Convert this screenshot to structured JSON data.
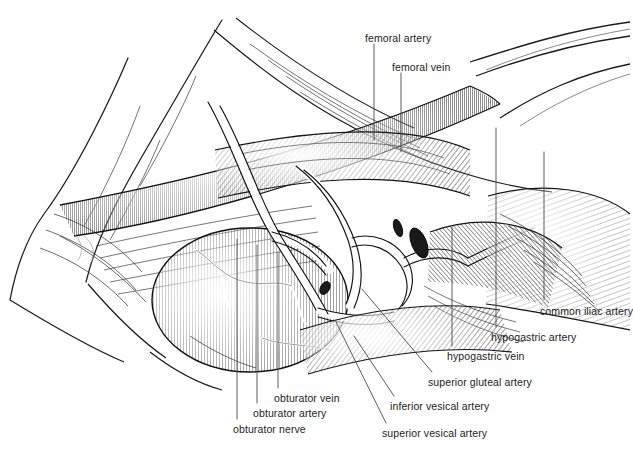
{
  "figure": {
    "title_fragment_cut_off": "any blood vessel together the result is an entire circuit",
    "background_color": "#ffffff",
    "ink_color": "#1b1b1b",
    "leader_line_color": "#4a4a4a",
    "technique": "pen-and-ink line engraving with hatching and stippling"
  },
  "labels": [
    {
      "id": "femoral-artery",
      "text": "femoral artery",
      "x": 365,
      "y": 33
    },
    {
      "id": "femoral-vein",
      "text": "femoral vein",
      "x": 392,
      "y": 62
    },
    {
      "id": "common-iliac-artery",
      "text": "common iliac artery",
      "x": 540,
      "y": 306
    },
    {
      "id": "hypogastric-artery",
      "text": "hypogastric artery",
      "x": 491,
      "y": 332
    },
    {
      "id": "hypogastric-vein",
      "text": "hypogastric vein",
      "x": 447,
      "y": 351
    },
    {
      "id": "superior-gluteal-artery",
      "text": "superior gluteal artery",
      "x": 428,
      "y": 377
    },
    {
      "id": "inferior-vesical-artery",
      "text": "inferior vesical artery",
      "x": 390,
      "y": 401
    },
    {
      "id": "superior-vesical-artery",
      "text": "superior vesical artery",
      "x": 382,
      "y": 428
    },
    {
      "id": "obturator-vein",
      "text": "obturator vein",
      "x": 274,
      "y": 393
    },
    {
      "id": "obturator-artery",
      "text": "obturator artery",
      "x": 253,
      "y": 408
    },
    {
      "id": "obturator-nerve",
      "text": "obturator nerve",
      "x": 233,
      "y": 424
    }
  ],
  "leader_lines": [
    {
      "id": "leader-femoral-artery",
      "points": "374,44 374,140"
    },
    {
      "id": "leader-femoral-vein",
      "points": "401,73 401,152"
    },
    {
      "id": "leader-common-iliac-artery",
      "points": "544,300 544,152"
    },
    {
      "id": "leader-hypogastric-artery",
      "points": "496,327 496,128"
    },
    {
      "id": "leader-hypogastric-vein",
      "points": "452,346 452,227"
    },
    {
      "id": "leader-superior-gluteal-artery",
      "points": "432,372 362,289"
    },
    {
      "id": "leader-inferior-vesical-artery",
      "points": "394,396 354,336"
    },
    {
      "id": "leader-superior-vesical-artery",
      "points": "386,423 336,322"
    },
    {
      "id": "leader-obturator-vein",
      "points": "278,388 278,252"
    },
    {
      "id": "leader-obturator-artery",
      "points": "257,403 257,245"
    },
    {
      "id": "leader-obturator-nerve",
      "points": "237,419 237,239"
    }
  ]
}
